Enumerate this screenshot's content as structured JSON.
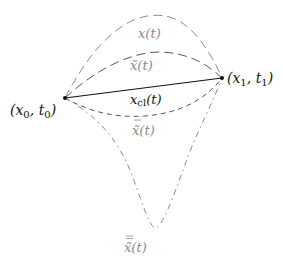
{
  "diagram": {
    "points": {
      "start": {
        "label": "(x₀, t₀)",
        "base": "(x",
        "sub1": "0",
        "mid": ", t",
        "sub2": "0",
        "end": ")"
      },
      "end": {
        "label": "(x₁, t₁)",
        "base": "(x",
        "sub1": "1",
        "mid": ", t",
        "sub2": "1",
        "end": ")"
      }
    },
    "paths": [
      {
        "id": "x",
        "label": "x(t)",
        "style": "long-dash",
        "color": "#8a8a8a"
      },
      {
        "id": "x-tilde",
        "label": "x̃(t)",
        "style": "long-dash",
        "color": "#555555"
      },
      {
        "id": "x-cl",
        "label_base": "x",
        "label_sub": "cl",
        "label_tail": "(t)",
        "style": "solid",
        "color": "#111111"
      },
      {
        "id": "x-bar-tilde",
        "label": "x̃̄(t)",
        "label_base": "x̃",
        "label_tail": "(t)",
        "style": "short-dash",
        "color": "#555555"
      },
      {
        "id": "x-bar-bar-tilde",
        "label": "x̃̄̄(t)",
        "label_base": "x̃",
        "label_tail": "(t)",
        "style": "dash-dot",
        "color": "#8a8a8a"
      }
    ]
  }
}
